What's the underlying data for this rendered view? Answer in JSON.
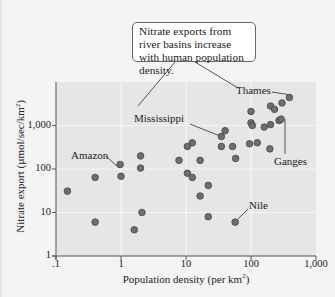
{
  "chart_data": {
    "type": "scatter",
    "title": "",
    "callout": "Nitrate exports from river basins increase with human population density.",
    "xlabel": "Population density (per km²)",
    "ylabel": "Nitrate export (µmol/sec/km²)",
    "xscale": "log",
    "yscale": "log",
    "xlim": [
      0.1,
      1000
    ],
    "ylim": [
      1,
      10000
    ],
    "xticks": [
      ".1",
      "1",
      "10",
      "100",
      "1,000"
    ],
    "yticks": [
      "1",
      "10",
      "100",
      "1,000"
    ],
    "grid": true,
    "marker_color": "#6e6e6e",
    "background": "#e8e8e8",
    "points": [
      {
        "x": 0.15,
        "y": 31
      },
      {
        "x": 0.4,
        "y": 64
      },
      {
        "x": 0.4,
        "y": 6
      },
      {
        "x": 0.97,
        "y": 127,
        "label": "Amazon"
      },
      {
        "x": 1.0,
        "y": 68,
        "label": "Amazon"
      },
      {
        "x": 2.0,
        "y": 200
      },
      {
        "x": 2.0,
        "y": 105
      },
      {
        "x": 2.1,
        "y": 10
      },
      {
        "x": 1.6,
        "y": 4
      },
      {
        "x": 7.8,
        "y": 158
      },
      {
        "x": 10.5,
        "y": 80
      },
      {
        "x": 12.5,
        "y": 64
      },
      {
        "x": 12.5,
        "y": 400
      },
      {
        "x": 10.5,
        "y": 330
      },
      {
        "x": 16.5,
        "y": 158
      },
      {
        "x": 22,
        "y": 42
      },
      {
        "x": 16.5,
        "y": 24
      },
      {
        "x": 22,
        "y": 8
      },
      {
        "x": 57,
        "y": 6,
        "label": "Nile"
      },
      {
        "x": 35,
        "y": 560,
        "label": "Mississippi"
      },
      {
        "x": 40,
        "y": 760
      },
      {
        "x": 35,
        "y": 330
      },
      {
        "x": 52,
        "y": 330
      },
      {
        "x": 58,
        "y": 175
      },
      {
        "x": 100,
        "y": 2100
      },
      {
        "x": 100,
        "y": 1150
      },
      {
        "x": 105,
        "y": 1000
      },
      {
        "x": 95,
        "y": 380
      },
      {
        "x": 125,
        "y": 400
      },
      {
        "x": 160,
        "y": 920
      },
      {
        "x": 200,
        "y": 1050
      },
      {
        "x": 195,
        "y": 290
      },
      {
        "x": 270,
        "y": 1300,
        "label": "Ganges"
      },
      {
        "x": 290,
        "y": 1400,
        "label": "Ganges"
      },
      {
        "x": 200,
        "y": 2800
      },
      {
        "x": 230,
        "y": 2350
      },
      {
        "x": 300,
        "y": 3300
      },
      {
        "x": 390,
        "y": 4400,
        "label": "Thames"
      }
    ],
    "annotations": [
      {
        "text": "Thames",
        "x": 390,
        "y": 4400
      },
      {
        "text": "Mississippi",
        "x": 35,
        "y": 560
      },
      {
        "text": "Amazon",
        "x": 1.0,
        "y": 68
      },
      {
        "text": "Ganges",
        "x": 280,
        "y": 1300
      },
      {
        "text": "Nile",
        "x": 57,
        "y": 6
      }
    ]
  },
  "labels": {
    "callout": "Nitrate exports from river basins increase with human population density.",
    "xlabel_main": "Population density (per km",
    "xlabel_sup": "2",
    "xlabel_end": ")",
    "ylabel_main": "Nitrate export (µmol/sec/km",
    "ylabel_sup": "2",
    "ylabel_end": ")",
    "thames": "Thames",
    "mississippi": "Mississippi",
    "amazon": "Amazon",
    "ganges": "Ganges",
    "nile": "Nile"
  }
}
